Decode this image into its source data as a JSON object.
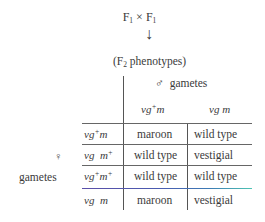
{
  "diagram": {
    "type": "punnett-square",
    "cross": {
      "parent1": "F",
      "parent1_sub": "1",
      "operator": "×",
      "parent2": "F",
      "parent2_sub": "1"
    },
    "arrow": "↓",
    "result_label": {
      "open": "(F",
      "sub": "2",
      "text": " phenotypes)"
    },
    "male_gametes": {
      "symbol": "♂",
      "label": "gametes"
    },
    "female_gametes": {
      "symbol": "♀",
      "label": "gametes"
    },
    "columns": [
      {
        "vg": "vg",
        "vg_sup": "+",
        "m": "m",
        "m_sup": ""
      },
      {
        "vg": "vg",
        "vg_sup": "",
        "m": " m",
        "m_sup": ""
      }
    ],
    "rows": [
      {
        "gamete": {
          "vg": "vg",
          "vg_sup": "+",
          "m": "m",
          "m_sup": ""
        },
        "cells": [
          "maroon",
          "wild type"
        ]
      },
      {
        "gamete": {
          "vg": "vg",
          "vg_sup": "",
          "m": "  m",
          "m_sup": "+"
        },
        "cells": [
          "wild type",
          "vestigial"
        ]
      },
      {
        "gamete": {
          "vg": "vg",
          "vg_sup": "+",
          "m": "m",
          "m_sup": "+"
        },
        "cells": [
          "wild type",
          "wild type"
        ]
      },
      {
        "gamete": {
          "vg": "vg",
          "vg_sup": "",
          "m": "  m",
          "m_sup": ""
        },
        "cells": [
          "maroon",
          "vestigial"
        ]
      }
    ],
    "colors": {
      "text": "#3a3a3a",
      "rule": "#666666",
      "highlight_rule_start": "#5b4fa8",
      "highlight_rule_end": "#4ec4b3"
    }
  }
}
